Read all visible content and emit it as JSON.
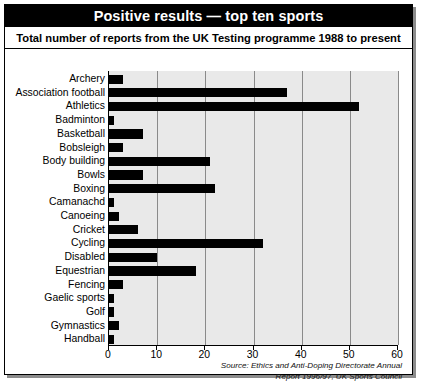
{
  "title": "Positive results — top ten sports",
  "subtitle": "Total number of reports from the UK Testing programme 1988 to present",
  "source_line1": "Source: Ethics and Anti-Doping Directorate Annual",
  "source_line2": "Report 1996/97, UK Sports Council",
  "colors": {
    "bar": "#000000",
    "plot_background": "#e9e9e9",
    "gridline": "#8a8a8a",
    "title_background": "#000000",
    "title_text": "#ffffff"
  },
  "chart_data": {
    "type": "bar",
    "orientation": "horizontal",
    "title": "Positive results — top ten sports",
    "subtitle": "Total number of reports from the UK Testing programme 1988 to present",
    "xlabel": "",
    "ylabel": "",
    "xlim": [
      0,
      60
    ],
    "xticks": [
      0,
      10,
      20,
      30,
      40,
      50,
      60
    ],
    "grid": true,
    "legend": false,
    "categories": [
      "Archery",
      "Association football",
      "Athletics",
      "Badminton",
      "Basketball",
      "Bobsleigh",
      "Body building",
      "Bowls",
      "Boxing",
      "Camanachd",
      "Canoeing",
      "Cricket",
      "Cycling",
      "Disabled",
      "Equestrian",
      "Fencing",
      "Gaelic sports",
      "Golf",
      "Gymnastics",
      "Handball"
    ],
    "values": [
      3,
      37,
      52,
      1,
      7,
      3,
      21,
      7,
      22,
      1,
      2,
      6,
      32,
      10,
      18,
      3,
      1,
      1,
      2,
      1
    ],
    "annotation": "Source: Ethics and Anti-Doping Directorate Annual Report 1996/97, UK Sports Council"
  }
}
